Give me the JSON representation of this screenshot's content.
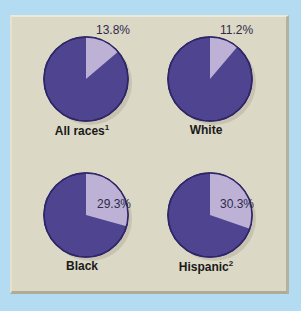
{
  "chart_data": {
    "type": "pie",
    "title": "",
    "charts": [
      {
        "label": "All races",
        "footnote": "1",
        "highlight_pct": 13.8,
        "rest_pct": 86.2,
        "label_text": "13.8%"
      },
      {
        "label": "White",
        "footnote": "",
        "highlight_pct": 11.2,
        "rest_pct": 88.8,
        "label_text": "11.2%"
      },
      {
        "label": "Black",
        "footnote": "",
        "highlight_pct": 29.3,
        "rest_pct": 70.7,
        "label_text": "29.3%"
      },
      {
        "label": "Hispanic",
        "footnote": "2",
        "highlight_pct": 30.3,
        "rest_pct": 69.7,
        "label_text": "30.3%"
      }
    ],
    "colors": {
      "highlight": "#bdb2d6",
      "rest": "#4f4490",
      "outline": "#2f2668",
      "background": "#dcd8c6",
      "page": "#b3dcf2"
    },
    "legend": null
  },
  "pies": [
    {
      "label": "All races",
      "sup": "1",
      "pct": "13.8%"
    },
    {
      "label": "White",
      "sup": "",
      "pct": "11.2%"
    },
    {
      "label": "Black",
      "sup": "",
      "pct": "29.3%"
    },
    {
      "label": "Hispanic",
      "sup": "2",
      "pct": "30.3%"
    }
  ]
}
